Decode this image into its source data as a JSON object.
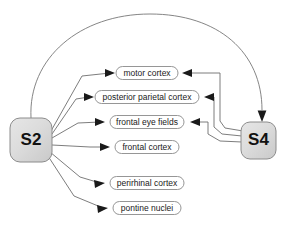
{
  "diagram": {
    "background_color": "#ffffff",
    "node_fill_color": "#d9d9d9",
    "node_border_color": "#8c8c8c",
    "box_fill_color": "#ffffff",
    "box_border_color": "#8a8a8a",
    "edge_color": "#6e6e6e",
    "arrow_color": "#1a1a1a",
    "source_nodes": [
      {
        "id": "s2",
        "label": "S2",
        "x": 10,
        "y": 118,
        "width": 42,
        "height": 44
      },
      {
        "id": "s4",
        "label": "S4",
        "x": 241,
        "y": 122,
        "width": 35,
        "height": 37
      }
    ],
    "target_boxes": [
      {
        "id": "motor-cortex",
        "label": "motor cortex",
        "cx": 147,
        "cy": 73,
        "width": 62,
        "height": 13,
        "from_s2": true,
        "from_s4": true
      },
      {
        "id": "posterior-parietal-cortex",
        "label": "posterior parietal cortex",
        "cx": 147,
        "cy": 97,
        "width": 104,
        "height": 13,
        "from_s2": true,
        "from_s4": true
      },
      {
        "id": "frontal-eye-fields",
        "label": "frontal eye fields",
        "cx": 147,
        "cy": 122,
        "width": 74,
        "height": 13,
        "from_s2": true,
        "from_s4": true
      },
      {
        "id": "frontal-cortex",
        "label": "frontal cortex",
        "cx": 147,
        "cy": 147,
        "width": 64,
        "height": 13,
        "from_s2": true,
        "from_s4": false
      },
      {
        "id": "perirhinal-cortex",
        "label": "perirhinal cortex",
        "cx": 147,
        "cy": 183,
        "width": 74,
        "height": 13,
        "from_s2": true,
        "from_s4": false
      },
      {
        "id": "pontine-nuclei",
        "label": "pontine nuclei",
        "cx": 147,
        "cy": 208,
        "width": 68,
        "height": 13,
        "from_s2": true,
        "from_s4": false
      }
    ],
    "arc_connection": {
      "from": "S2",
      "to": "S4",
      "description": "long arc from top of S2 over the top of the diagram down into the top of S4",
      "arrow_direction": "down"
    }
  }
}
